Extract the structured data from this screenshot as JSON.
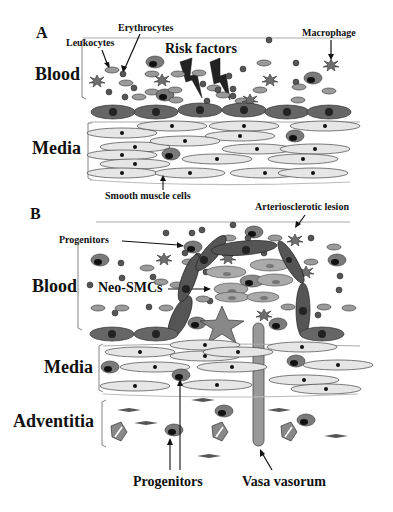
{
  "panels": [
    {
      "id": "A",
      "letter": "A",
      "labels": {
        "blood": "Blood",
        "media": "Media",
        "leukocytes": "Leukocytes",
        "erythrocytes": "Erythrocytes",
        "risk_factors": "Risk factors",
        "macrophage": "Macrophage",
        "smooth_muscle_cells": "Smooth muscle cells"
      }
    },
    {
      "id": "B",
      "letter": "B",
      "labels": {
        "arteriosclerotic_lesion": "Arteriosclerotic lesion",
        "progenitors_top": "Progenitors",
        "blood": "Blood",
        "neo_smcs": "Neo-SMCs",
        "media": "Media",
        "adventitia": "Adventitia",
        "progenitors_bottom": "Progenitors",
        "vasa_vasorum": "Vasa vasorum"
      }
    }
  ],
  "colors": {
    "smc_fill": "#e6e6e6",
    "endothelial_fill": "#666666",
    "leukocyte_fill": "#9a9a9a",
    "erythrocyte_fill": "#555555",
    "macrophage_fill": "#777777",
    "progenitor_fill": "#707070",
    "nucleus": "#111111",
    "line": "#444444"
  }
}
